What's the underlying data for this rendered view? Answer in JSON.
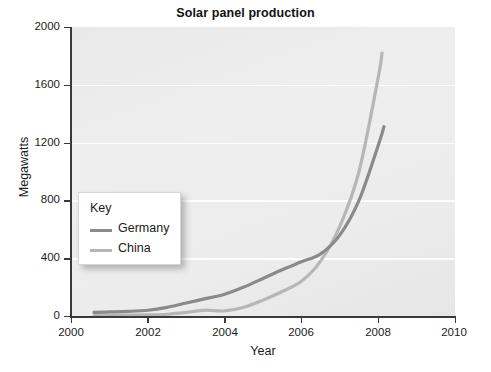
{
  "chart_data": {
    "type": "line",
    "title": "Solar panel production",
    "xlabel": "Year",
    "ylabel": "Megawatts",
    "xlim": [
      2000,
      2010
    ],
    "ylim": [
      0,
      2000
    ],
    "xticks": [
      2000,
      2002,
      2004,
      2006,
      2008,
      2010
    ],
    "yticks": [
      0,
      400,
      800,
      1200,
      1600,
      2000
    ],
    "grid": "horizontal",
    "legend_position": "center-left-inside",
    "legend_title": "Key",
    "series": [
      {
        "name": "Germany",
        "color": "#8a8a8a",
        "x": [
          2000.6,
          2001,
          2001.5,
          2002,
          2002.5,
          2003,
          2003.5,
          2004,
          2004.5,
          2005,
          2005.5,
          2006,
          2006.5,
          2007,
          2007.5,
          2008,
          2008.15
        ],
        "values": [
          25,
          28,
          32,
          40,
          60,
          90,
          120,
          150,
          200,
          260,
          320,
          375,
          430,
          560,
          800,
          1180,
          1310
        ]
      },
      {
        "name": "China",
        "color": "#b6b6b6",
        "x": [
          2000.6,
          2001,
          2001.5,
          2002,
          2002.5,
          2003,
          2003.5,
          2004,
          2004.5,
          2005,
          2005.5,
          2006,
          2006.5,
          2007,
          2007.5,
          2008,
          2008.1
        ],
        "values": [
          3,
          4,
          6,
          8,
          12,
          25,
          40,
          35,
          60,
          110,
          170,
          240,
          380,
          620,
          1000,
          1650,
          1820
        ]
      }
    ]
  },
  "axes": {
    "y_tick_labels": [
      "0",
      "400",
      "800",
      "1200",
      "1600",
      "2000"
    ],
    "x_tick_labels": [
      "2000",
      "2002",
      "2004",
      "2006",
      "2008",
      "2010"
    ]
  },
  "legend": {
    "title": "Key",
    "entries": [
      {
        "label": "Germany",
        "color": "#8a8a8a"
      },
      {
        "label": "China",
        "color": "#b6b6b6"
      }
    ]
  }
}
